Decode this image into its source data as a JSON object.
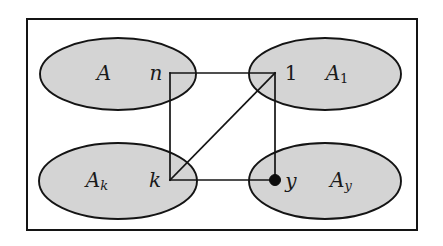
{
  "figure": {
    "type": "set-graph-diagram",
    "background_color": "#ffffff",
    "frame": {
      "stroke_color": "#141414",
      "x": 27,
      "y": 19,
      "width": 390,
      "height": 211
    },
    "ellipse_fill": "#d4d4d4",
    "ellipse_stroke": "#141414",
    "ellipses": [
      {
        "id": "ellipse-A",
        "set_label": "A",
        "cx": 118,
        "cy": 74,
        "rx": 78,
        "ry": 36
      },
      {
        "id": "ellipse-A1",
        "set_label": "A",
        "set_subscript": "1",
        "subscript_upright": true,
        "cx": 325,
        "cy": 74,
        "rx": 76,
        "ry": 36
      },
      {
        "id": "ellipse-Ak",
        "set_label": "A",
        "set_subscript": "k",
        "subscript_upright": false,
        "cx": 118,
        "cy": 181,
        "rx": 79,
        "ry": 38
      },
      {
        "id": "ellipse-Ay",
        "set_label": "A",
        "set_subscript": "y",
        "subscript_upright": false,
        "cx": 325,
        "cy": 181,
        "rx": 76,
        "ry": 38
      }
    ],
    "set_labels": [
      {
        "id": "label-A",
        "text": "A",
        "sub": "",
        "x": 104,
        "y": 74,
        "sub_upright": false
      },
      {
        "id": "label-A1",
        "text": "A",
        "sub": "1",
        "x": 341,
        "y": 74,
        "sub_upright": true
      },
      {
        "id": "label-Ak",
        "text": "A",
        "sub": "k",
        "x": 101,
        "y": 181,
        "sub_upright": false
      },
      {
        "id": "label-Ay",
        "text": "A",
        "sub": "y",
        "x": 345,
        "y": 181,
        "sub_upright": false
      }
    ],
    "graph": {
      "vertices": [
        {
          "id": "vertex-n",
          "label": "n",
          "x": 170,
          "y": 73,
          "label_x": 156,
          "label_y": 74,
          "filled": false,
          "upright": false
        },
        {
          "id": "vertex-1",
          "label": "1",
          "x": 275,
          "y": 73,
          "label_x": 290,
          "label_y": 74,
          "filled": false,
          "upright": true
        },
        {
          "id": "vertex-k",
          "label": "k",
          "x": 170,
          "y": 180,
          "label_x": 155,
          "label_y": 181,
          "filled": false,
          "upright": false
        },
        {
          "id": "vertex-y",
          "label": "y",
          "x": 275,
          "y": 180,
          "label_x": 290,
          "label_y": 182,
          "filled": true,
          "upright": false
        }
      ],
      "vertex_dot_radius": 5.5,
      "edges": [
        {
          "id": "edge-n-1",
          "from": "n",
          "to": "1",
          "x1": 170,
          "y1": 73,
          "x2": 275,
          "y2": 73
        },
        {
          "id": "edge-n-k",
          "from": "n",
          "to": "k",
          "x1": 170,
          "y1": 73,
          "x2": 170,
          "y2": 180
        },
        {
          "id": "edge-k-y",
          "from": "k",
          "to": "y",
          "x1": 170,
          "y1": 180,
          "x2": 275,
          "y2": 180
        },
        {
          "id": "edge-1-y",
          "from": "1",
          "to": "y",
          "x1": 275,
          "y1": 73,
          "x2": 275,
          "y2": 180
        },
        {
          "id": "edge-k-1",
          "from": "k",
          "to": "1",
          "x1": 170,
          "y1": 180,
          "x2": 275,
          "y2": 73
        }
      ]
    }
  }
}
